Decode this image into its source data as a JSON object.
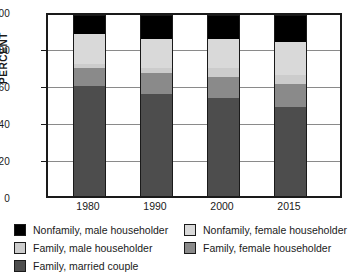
{
  "chart_data": {
    "type": "bar",
    "subtype": "stacked-100-percent",
    "title": "",
    "xlabel": "",
    "ylabel": "PERCENT",
    "ylim": [
      0,
      100
    ],
    "yticks": [
      0,
      20,
      40,
      60,
      80,
      100
    ],
    "grid": true,
    "legend_position": "below",
    "categories": [
      "1980",
      "1990",
      "2000",
      "2015"
    ],
    "series": [
      {
        "name": "Family, married couple",
        "color": "#4d4d4d",
        "values": [
          61.0,
          56.5,
          54.0,
          49.0
        ]
      },
      {
        "name": "Family, female householder",
        "color": "#8a8a8a",
        "values": [
          10.0,
          11.5,
          12.0,
          13.0
        ]
      },
      {
        "name": "Family, male householder",
        "color": "#cccccc",
        "values": [
          2.0,
          3.0,
          4.5,
          5.0
        ]
      },
      {
        "name": "Nonfamily, female householder",
        "color": "#d9d9d9",
        "values": [
          16.5,
          15.5,
          16.0,
          18.0
        ]
      },
      {
        "name": "Nonfamily, male householder",
        "color": "#000000",
        "values": [
          10.5,
          13.5,
          13.5,
          15.0
        ]
      }
    ]
  },
  "axis": {
    "y_title": "PERCENT",
    "y_labels": [
      "100",
      "80",
      "60",
      "40",
      "20",
      "0"
    ],
    "x_labels": [
      "1980",
      "1990",
      "2000",
      "2015"
    ]
  },
  "legend": {
    "left_column": [
      {
        "label": "Nonfamily, male householder",
        "color": "#000000"
      },
      {
        "label": "Family, male householder",
        "color": "#cccccc"
      },
      {
        "label": "Family, married couple",
        "color": "#4d4d4d"
      }
    ],
    "right_column": [
      {
        "label": "Nonfamily, female householder",
        "color": "#d9d9d9"
      },
      {
        "label": "Family, female householder",
        "color": "#8a8a8a"
      }
    ]
  },
  "colors": {
    "axis": "#1a1a1a",
    "grid": "#8a8a8a",
    "background": "#ffffff"
  }
}
